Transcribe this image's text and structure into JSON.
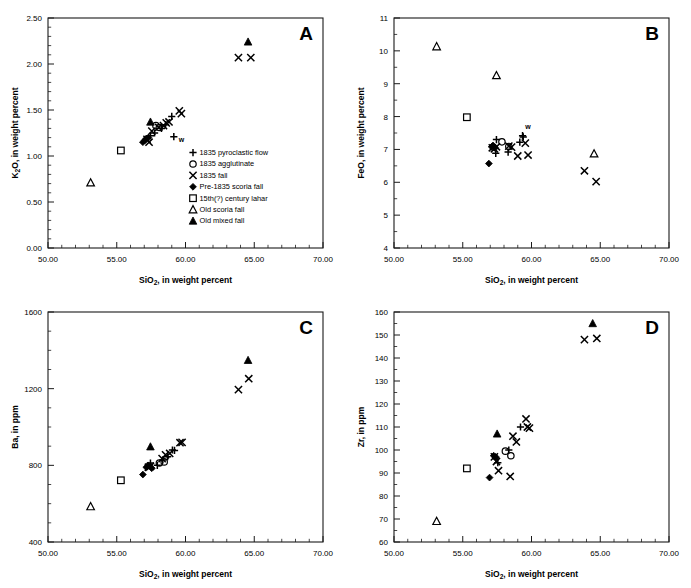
{
  "figure": {
    "panel_count": 4,
    "background": "#ffffff",
    "marker_color": "#000000"
  },
  "legend": {
    "position": "inside panel A lower-right",
    "items": [
      {
        "symbol": "plus",
        "label": "1835 pyroclastic flow"
      },
      {
        "symbol": "circle-open",
        "label": "1835 agglutinate"
      },
      {
        "symbol": "cross",
        "label": "1835 fall"
      },
      {
        "symbol": "diamond-filled",
        "label": "Pre-1835 scoria fall"
      },
      {
        "symbol": "square-open",
        "label": "15th(?) century lahar"
      },
      {
        "symbol": "triangle-open",
        "label": "Old scoria fall"
      },
      {
        "symbol": "triangle-filled",
        "label": "Old mixed fall"
      }
    ]
  },
  "annotations": {
    "w_label": "w"
  },
  "chart_data": [
    {
      "id": "A",
      "type": "scatter",
      "panel_letter": "A",
      "title": "",
      "xlabel": "SiO2, in weight percent",
      "xlabel_html": "SiO<sub>2</sub>, in weight percent",
      "ylabel": "K2O, in weight percent",
      "ylabel_html": "K<sub>2</sub>O, in weight percent",
      "xlim": [
        50.0,
        70.0
      ],
      "ylim": [
        0.0,
        2.5
      ],
      "xticks": [
        50.0,
        55.0,
        60.0,
        65.0,
        70.0
      ],
      "xticklabels": [
        "50.00",
        "55.00",
        "60.00",
        "65.00",
        "70.00"
      ],
      "yticks": [
        0.0,
        0.5,
        1.0,
        1.5,
        2.0,
        2.5
      ],
      "yticklabels": [
        "0.00",
        "0.50",
        "1.00",
        "1.50",
        "2.00",
        "2.50"
      ],
      "minor_x_count": 5,
      "minor_y_count": 5,
      "grid": false,
      "legend_shown": true,
      "series": [
        {
          "name": "1835 pyroclastic flow",
          "symbol": "plus",
          "points": [
            [
              57.45,
              1.22
            ],
            [
              57.75,
              1.25
            ],
            [
              58.25,
              1.3
            ],
            [
              58.55,
              1.34
            ],
            [
              59.0,
              1.43
            ],
            [
              59.15,
              1.21
            ]
          ]
        },
        {
          "name": "1835 agglutinate",
          "symbol": "circle-open",
          "points": [
            [
              57.85,
              1.33
            ],
            [
              58.1,
              1.31
            ]
          ]
        },
        {
          "name": "1835 fall",
          "symbol": "cross",
          "points": [
            [
              57.2,
              1.18
            ],
            [
              57.35,
              1.15
            ],
            [
              57.55,
              1.27
            ],
            [
              58.05,
              1.31
            ],
            [
              58.4,
              1.33
            ],
            [
              58.6,
              1.36
            ],
            [
              58.8,
              1.37
            ],
            [
              59.55,
              1.49
            ],
            [
              59.7,
              1.46
            ],
            [
              63.85,
              2.07
            ],
            [
              64.75,
              2.07
            ]
          ]
        },
        {
          "name": "Pre-1835 scoria fall",
          "symbol": "diamond-filled",
          "points": [
            [
              56.9,
              1.15
            ],
            [
              57.05,
              1.17
            ],
            [
              57.15,
              1.19
            ],
            [
              57.3,
              1.2
            ]
          ]
        },
        {
          "name": "15th(?) century lahar",
          "symbol": "square-open",
          "points": [
            [
              55.3,
              1.06
            ]
          ]
        },
        {
          "name": "Old scoria fall",
          "symbol": "triangle-open",
          "points": [
            [
              53.1,
              0.71
            ]
          ]
        },
        {
          "name": "Old mixed fall",
          "symbol": "triangle-filled",
          "points": [
            [
              57.45,
              1.37
            ],
            [
              64.55,
              2.24
            ]
          ]
        }
      ],
      "point_annotations": [
        {
          "x": 59.15,
          "y": 1.21,
          "text": "w",
          "dx": 5,
          "dy": 5
        }
      ]
    },
    {
      "id": "B",
      "type": "scatter",
      "panel_letter": "B",
      "title": "",
      "xlabel": "SiO2, in weight percent",
      "xlabel_html": "SiO<sub>2</sub>, in weight percent",
      "ylabel": "FeO, in weight percent",
      "ylabel_html": "FeO, in weight percent",
      "xlim": [
        50.0,
        70.0
      ],
      "ylim": [
        4,
        11
      ],
      "xticks": [
        50.0,
        55.0,
        60.0,
        65.0,
        70.0
      ],
      "xticklabels": [
        "50.00",
        "55.00",
        "60.00",
        "65.00",
        "70.00"
      ],
      "yticks": [
        4,
        5,
        6,
        7,
        8,
        9,
        10,
        11
      ],
      "yticklabels": [
        "4",
        "5",
        "6",
        "7",
        "8",
        "9",
        "10",
        "11"
      ],
      "minor_x_count": 5,
      "minor_y_count": 2,
      "grid": false,
      "legend_shown": false,
      "series": [
        {
          "name": "1835 pyroclastic flow",
          "symbol": "plus",
          "points": [
            [
              57.45,
              7.3
            ],
            [
              57.4,
              6.88
            ],
            [
              58.3,
              6.92
            ],
            [
              59.15,
              7.22
            ],
            [
              59.35,
              7.42
            ],
            [
              59.4,
              7.38
            ]
          ]
        },
        {
          "name": "1835 agglutinate",
          "symbol": "circle-open",
          "points": [
            [
              57.85,
              7.23
            ],
            [
              58.35,
              7.09
            ]
          ]
        },
        {
          "name": "1835 fall",
          "symbol": "cross",
          "points": [
            [
              57.15,
              7.05
            ],
            [
              57.3,
              7.02
            ],
            [
              57.45,
              7.08
            ],
            [
              58.35,
              7.1
            ],
            [
              58.55,
              7.07
            ],
            [
              59.0,
              6.8
            ],
            [
              59.55,
              7.19
            ],
            [
              59.75,
              6.83
            ],
            [
              63.85,
              6.35
            ],
            [
              64.7,
              6.02
            ]
          ]
        },
        {
          "name": "Pre-1835 scoria fall",
          "symbol": "diamond-filled",
          "points": [
            [
              56.9,
              6.57
            ],
            [
              57.1,
              7.08
            ],
            [
              57.2,
              7.12
            ],
            [
              57.35,
              7.05
            ]
          ]
        },
        {
          "name": "15th(?) century lahar",
          "symbol": "square-open",
          "points": [
            [
              55.3,
              7.98
            ]
          ]
        },
        {
          "name": "Old scoria fall",
          "symbol": "triangle-open",
          "points": [
            [
              53.1,
              10.13
            ],
            [
              57.45,
              9.25
            ],
            [
              64.55,
              6.87
            ]
          ]
        },
        {
          "name": "Old mixed fall",
          "symbol": "triangle-filled",
          "points": []
        }
      ],
      "point_annotations": [
        {
          "x": 59.4,
          "y": 7.38,
          "text": "w",
          "dx": 2,
          "dy": -8
        }
      ]
    },
    {
      "id": "C",
      "type": "scatter",
      "panel_letter": "C",
      "title": "",
      "xlabel": "SiO2, in weight percent",
      "xlabel_html": "SiO<sub>2</sub>, in weight percent",
      "ylabel": "Ba, in ppm",
      "ylabel_html": "Ba, in ppm",
      "xlim": [
        50.0,
        70.0
      ],
      "ylim": [
        400,
        1600
      ],
      "xticks": [
        50.0,
        55.0,
        60.0,
        65.0,
        70.0
      ],
      "xticklabels": [
        "50.00",
        "55.00",
        "60.00",
        "65.00",
        "70.00"
      ],
      "yticks": [
        400,
        800,
        1200,
        1600
      ],
      "yticklabels": [
        "400",
        "800",
        "1200",
        "1600"
      ],
      "minor_x_count": 5,
      "minor_y_count": 4,
      "grid": false,
      "legend_shown": false,
      "series": [
        {
          "name": "1835 pyroclastic flow",
          "symbol": "plus",
          "points": [
            [
              57.45,
              812
            ],
            [
              57.95,
              800
            ],
            [
              58.35,
              828
            ],
            [
              58.7,
              845
            ],
            [
              59.05,
              880
            ],
            [
              59.2,
              878
            ]
          ]
        },
        {
          "name": "1835 agglutinate",
          "symbol": "circle-open",
          "points": [
            [
              58.1,
              812
            ],
            [
              58.45,
              818
            ]
          ]
        },
        {
          "name": "1835 fall",
          "symbol": "cross",
          "points": [
            [
              57.3,
              790
            ],
            [
              57.45,
              795
            ],
            [
              58.3,
              835
            ],
            [
              58.55,
              855
            ],
            [
              58.85,
              862
            ],
            [
              59.6,
              918
            ],
            [
              59.75,
              920
            ],
            [
              63.85,
              1195
            ],
            [
              64.6,
              1252
            ]
          ]
        },
        {
          "name": "Pre-1835 scoria fall",
          "symbol": "diamond-filled",
          "points": [
            [
              56.9,
              752
            ],
            [
              57.15,
              790
            ],
            [
              57.3,
              800
            ],
            [
              57.55,
              785
            ]
          ]
        },
        {
          "name": "15th(?) century lahar",
          "symbol": "square-open",
          "points": [
            [
              55.3,
              722
            ]
          ]
        },
        {
          "name": "Old scoria fall",
          "symbol": "triangle-open",
          "points": [
            [
              53.1,
              585
            ]
          ]
        },
        {
          "name": "Old mixed fall",
          "symbol": "triangle-filled",
          "points": [
            [
              57.45,
              897
            ],
            [
              64.55,
              1348
            ]
          ]
        }
      ],
      "point_annotations": []
    },
    {
      "id": "D",
      "type": "scatter",
      "panel_letter": "D",
      "title": "",
      "xlabel": "SiO2, in weight percent",
      "xlabel_html": "SiO<sub>2</sub>, in weight percent",
      "ylabel": "Zr, in ppm",
      "ylabel_html": "Zr, in ppm",
      "xlim": [
        50.0,
        70.0
      ],
      "ylim": [
        60,
        160
      ],
      "xticks": [
        50.0,
        55.0,
        60.0,
        65.0,
        70.0
      ],
      "xticklabels": [
        "50.00",
        "55.00",
        "60.00",
        "65.00",
        "70.00"
      ],
      "yticks": [
        60,
        70,
        80,
        90,
        100,
        110,
        120,
        130,
        140,
        150,
        160
      ],
      "yticklabels": [
        "60",
        "70",
        "80",
        "90",
        "100",
        "110",
        "120",
        "130",
        "140",
        "150",
        "160"
      ],
      "minor_x_count": 5,
      "minor_y_count": 2,
      "grid": false,
      "legend_shown": false,
      "series": [
        {
          "name": "1835 pyroclastic flow",
          "symbol": "plus",
          "points": [
            [
              57.4,
              96.5
            ],
            [
              57.55,
              94.5
            ],
            [
              58.35,
              100.0
            ],
            [
              59.2,
              110.0
            ]
          ]
        },
        {
          "name": "1835 agglutinate",
          "symbol": "circle-open",
          "points": [
            [
              58.1,
              99.5
            ],
            [
              58.5,
              97.5
            ]
          ]
        },
        {
          "name": "1835 fall",
          "symbol": "cross",
          "points": [
            [
              57.3,
              97.0
            ],
            [
              57.45,
              95.0
            ],
            [
              57.6,
              91.0
            ],
            [
              58.45,
              88.5
            ],
            [
              58.65,
              106.0
            ],
            [
              58.9,
              103.5
            ],
            [
              59.6,
              113.5
            ],
            [
              59.7,
              110.0
            ],
            [
              59.85,
              109.5
            ],
            [
              63.85,
              148.0
            ],
            [
              64.75,
              148.5
            ]
          ]
        },
        {
          "name": "Pre-1835 scoria fall",
          "symbol": "diamond-filled",
          "points": [
            [
              56.95,
              88.0
            ],
            [
              57.25,
              97.5
            ],
            [
              57.4,
              97.0
            ]
          ]
        },
        {
          "name": "15th(?) century lahar",
          "symbol": "square-open",
          "points": [
            [
              55.3,
              92.0
            ]
          ]
        },
        {
          "name": "Old scoria fall",
          "symbol": "triangle-open",
          "points": [
            [
              53.1,
              69.0
            ]
          ]
        },
        {
          "name": "Old mixed fall",
          "symbol": "triangle-filled",
          "points": [
            [
              57.5,
              107.0
            ],
            [
              64.45,
              155.0
            ]
          ]
        }
      ],
      "point_annotations": []
    }
  ]
}
